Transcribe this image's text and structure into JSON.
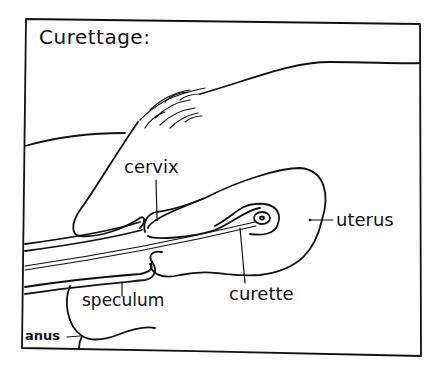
{
  "diagram": {
    "title": "Curettage:",
    "labels": {
      "cervix": "cervix",
      "uterus": "uterus",
      "curette": "curette",
      "speculum": "speculum",
      "anus": "anus"
    },
    "style": {
      "ink_color": "#111111",
      "background": "#ffffff"
    }
  }
}
